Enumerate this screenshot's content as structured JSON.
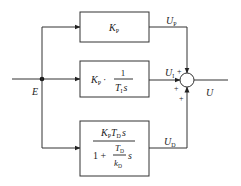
{
  "diagram": {
    "type": "PID controller block diagram (parallel form)",
    "input_signal": "E",
    "output_signal": "U",
    "blocks": [
      {
        "id": "proportional",
        "label": "K_P",
        "parts": {
          "k": "K",
          "k_sub": "P"
        },
        "output": {
          "sym": "U",
          "sub": "P"
        }
      },
      {
        "id": "integral",
        "label": "K_P · 1/(T_I s)",
        "parts": {
          "k": "K",
          "k_sub": "P",
          "dot": "·",
          "num": "1",
          "den_T": "T",
          "den_T_sub": "I",
          "den_s": "s"
        },
        "output": {
          "sym": "U",
          "sub": "I"
        }
      },
      {
        "id": "derivative",
        "label": "K_P T_D s / (1 + (T_D / k_D) s)",
        "parts": {
          "k": "K",
          "k_sub": "P",
          "T": "T",
          "T_sub": "D",
          "s": "s",
          "one_plus": "1 +",
          "inner_T": "T",
          "inner_T_sub": "D",
          "inner_k": "k",
          "inner_k_sub": "D",
          "inner_s": "s"
        },
        "output": {
          "sym": "U",
          "sub": "D"
        }
      }
    ],
    "summing_junction": {
      "signs": [
        "+",
        "+",
        "+"
      ]
    }
  }
}
